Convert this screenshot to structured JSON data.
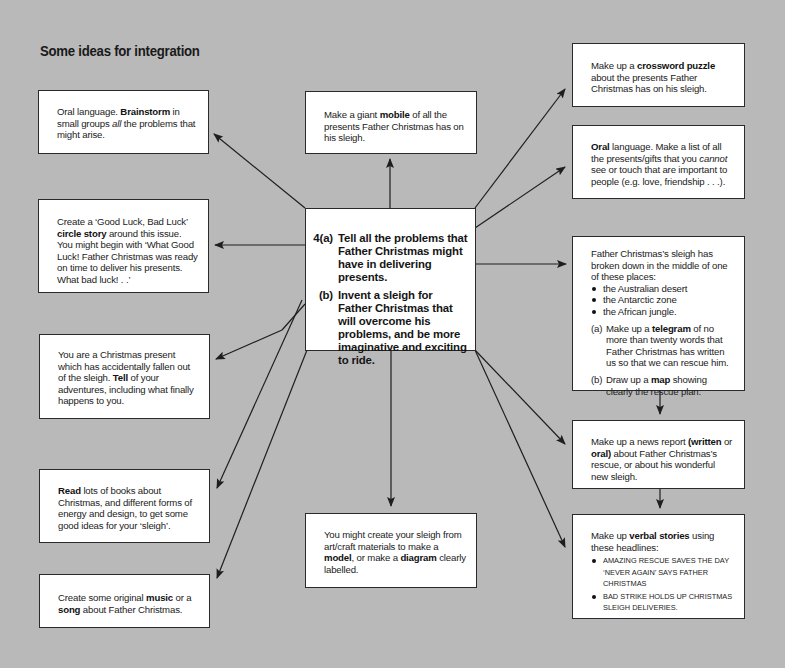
{
  "title": "Some ideas for integration",
  "central": {
    "a_label": "4(a)",
    "a_text": "Tell all the problems that Father Christmas might have in delivering presents.",
    "b_label": "(b)",
    "b_text": "Invent a sleigh for Father Christmas that will overcome his problems, and be more imaginative and exciting to ride."
  },
  "left": {
    "brainstorm": {
      "pre": "Oral language. ",
      "bold": "Brainstorm",
      "mid": " in small groups ",
      "italic": "all",
      "post": " the problems that might arise."
    },
    "circle_story": {
      "pre": "Create a ‘Good Luck, Bad Luck’ ",
      "bold": "circle story",
      "post": " around this issue. You might begin with ‘What Good Luck! Father Christmas was ready on time to deliver his presents. What bad luck! . .’"
    },
    "present": {
      "pre": "You are a Christmas present which has accidentally fallen out of the sleigh. ",
      "bold": "Tell",
      "post": " of your adventures, including what finally happens to you."
    },
    "read": {
      "bold": "Read",
      "post": " lots of books about Christmas, and different forms of energy and design, to get some good ideas for your ‘sleigh’."
    },
    "music": {
      "pre": "Create some original ",
      "bold1": "music",
      "mid": " or a ",
      "bold2": "song",
      "post": " about Father Christmas."
    }
  },
  "center": {
    "mobile": {
      "pre": "Make a giant ",
      "bold": "mobile",
      "post": " of all the presents Father Christmas has on his sleigh."
    },
    "model": {
      "pre": "You might create your sleigh from art/craft materials to make a ",
      "bold1": "model",
      "mid": ", or make a ",
      "bold2": "diagram",
      "post": " clearly labelled."
    }
  },
  "right": {
    "crossword": {
      "pre": "Make up a ",
      "bold": "crossword puzzle",
      "post": " about the presents Father Christmas has on his sleigh."
    },
    "oral_list": {
      "bold": "Oral",
      "pre": " language. Make a list of all the presents/gifts that you ",
      "italic": "cannot",
      "post": " see or touch that are important to people (e.g. love, friendship . . .)."
    },
    "sleigh_broken": {
      "intro": "Father Christmas’s sleigh has broken down in the middle of one of these places:",
      "places": [
        "the Australian desert",
        "the Antarctic zone",
        "the African jungle."
      ],
      "a_label": "(a)",
      "a_pre": "Make up a ",
      "a_bold": "telegram",
      "a_post": " of no more than twenty words that Father Christmas has written us so that we can rescue him.",
      "b_label": "(b)",
      "b_pre": "Draw up a ",
      "b_bold": "map",
      "b_post": " showing clearly the rescue plan."
    },
    "news": {
      "pre": "Make up a news report ",
      "bold": "(written",
      "mid": " or ",
      "bold2": "oral)",
      "post": " about Father Christmas’s rescue, or about his wonderful new sleigh."
    },
    "verbal": {
      "pre": "Make up ",
      "bold": "verbal stories",
      "post": " using these headlines:",
      "headlines": [
        "AMAZING RESCUE SAVES THE DAY ‘NEVER AGAIN’ SAYS FATHER CHRISTMAS",
        "BAD STRIKE HOLDS UP CHRISTMAS SLEIGH DELIVERIES."
      ]
    }
  },
  "colors": {
    "background": "#b9b9b9",
    "box": "#ffffff",
    "line": "#1e1e1e"
  }
}
